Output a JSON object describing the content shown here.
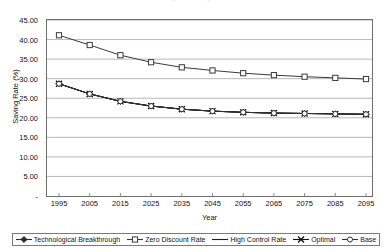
{
  "chart_title_fragment": "Figure  Saving Rate",
  "chart_data": {
    "type": "line",
    "title": "",
    "xlabel": "Year",
    "ylabel": "Saving Rate (%)",
    "x": [
      1995,
      2005,
      2015,
      2025,
      2035,
      2045,
      2055,
      2065,
      2075,
      2085,
      2095
    ],
    "xticklabels": [
      "1995",
      "2005",
      "2015",
      "2025",
      "2035",
      "2045",
      "2055",
      "2065",
      "2075",
      "2085",
      "2095"
    ],
    "yticklabels": [
      "-",
      "5.00",
      "10.00",
      "15.00",
      "20.00",
      "25.00",
      "30.00",
      "35.00",
      "40.00",
      "45.00"
    ],
    "ytickvalues": [
      0,
      5,
      10,
      15,
      20,
      25,
      30,
      35,
      40,
      45
    ],
    "ylim": [
      0,
      45
    ],
    "grid": "horizontal",
    "legend_position": "bottom",
    "series": [
      {
        "name": "Technological Breakthrough",
        "marker": "diamond",
        "color": "#2b2b2b",
        "values": [
          28.7,
          26.1,
          24.2,
          23.0,
          22.2,
          21.7,
          21.4,
          21.2,
          21.1,
          21.0,
          20.9
        ]
      },
      {
        "name": "Zero Discount Rate",
        "marker": "open-square",
        "color": "#3a3a3a",
        "values": [
          41.1,
          38.6,
          36.0,
          34.2,
          32.9,
          32.1,
          31.4,
          30.9,
          30.5,
          30.2,
          29.9
        ]
      },
      {
        "name": "High Control Rate",
        "marker": "none",
        "color": "#1f1f1f",
        "values": [
          28.7,
          26.1,
          24.2,
          23.0,
          22.2,
          21.7,
          21.4,
          21.2,
          21.1,
          21.0,
          20.9
        ]
      },
      {
        "name": "Optimal",
        "marker": "cross-x",
        "color": "#111111",
        "values": [
          28.7,
          26.1,
          24.2,
          23.0,
          22.2,
          21.7,
          21.4,
          21.2,
          21.1,
          21.0,
          20.9
        ]
      },
      {
        "name": "Base",
        "marker": "open-circle",
        "color": "#333333",
        "values": [
          28.7,
          26.1,
          24.2,
          23.0,
          22.2,
          21.7,
          21.4,
          21.2,
          21.1,
          21.0,
          20.9
        ]
      }
    ]
  }
}
